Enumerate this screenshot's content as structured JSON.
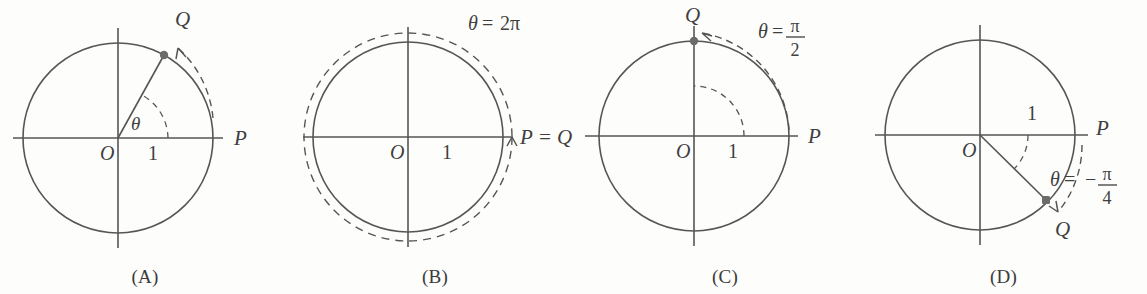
{
  "figure": {
    "background_color": "#fdfdfc",
    "stroke_color": "#555555",
    "text_color": "#3f3f3f",
    "point_color": "#6b6b6b"
  },
  "panels": [
    {
      "id": "A",
      "caption": "(A)",
      "center_label": "O",
      "radius_label": "1",
      "start_point_label": "P",
      "end_point_label": "Q",
      "angle_label": "θ",
      "angle_equation": null,
      "angle_degrees": 61,
      "direction": "counterclockwise",
      "outer_dashed_circle": false
    },
    {
      "id": "B",
      "caption": "(B)",
      "center_label": "O",
      "radius_label": "1",
      "start_point_label": null,
      "end_point_label": null,
      "combined_point_label": "P = Q",
      "angle_label": "θ",
      "angle_equation": {
        "lhs": "θ",
        "eq": "=",
        "rhs": "2π",
        "type": "plain"
      },
      "angle_degrees": 360,
      "direction": "counterclockwise",
      "outer_dashed_circle": true
    },
    {
      "id": "C",
      "caption": "(C)",
      "center_label": "O",
      "radius_label": "1",
      "start_point_label": "P",
      "end_point_label": "Q",
      "angle_label": "θ",
      "angle_equation": {
        "lhs": "θ",
        "eq": "=",
        "numerator": "π",
        "denominator": "2",
        "sign": "",
        "type": "fraction"
      },
      "angle_degrees": 90,
      "direction": "counterclockwise",
      "outer_dashed_circle": false
    },
    {
      "id": "D",
      "caption": "(D)",
      "center_label": "O",
      "radius_label": "1",
      "start_point_label": "P",
      "end_point_label": "Q",
      "angle_label": "θ",
      "angle_equation": {
        "lhs": "θ",
        "eq": "=",
        "numerator": "π",
        "denominator": "4",
        "sign": "−",
        "type": "fraction"
      },
      "angle_degrees": -46,
      "direction": "clockwise",
      "outer_dashed_circle": false
    }
  ]
}
